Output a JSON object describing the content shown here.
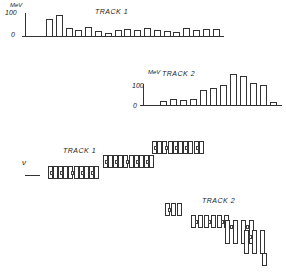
{
  "figure": {
    "panel_track1_hist": {
      "label": "TRACK 1",
      "unit": "MeV",
      "tick_top": "100",
      "tick_zero": "0"
    },
    "panel_track2_hist": {
      "label": "TRACK 2",
      "unit": "MeV",
      "tick_top": "100",
      "tick_zero": "0"
    },
    "panel_track1_cells": {
      "label": "TRACK 1",
      "beam_label": "ν"
    },
    "panel_track2_cells": {
      "label": "TRACK 2"
    }
  },
  "chart_data": [
    {
      "type": "bar",
      "title": "TRACK 1",
      "ylabel": "MeV",
      "ylim": [
        0,
        110
      ],
      "yticks": [
        0,
        100
      ],
      "values": [
        75,
        95,
        35,
        25,
        40,
        22,
        15,
        25,
        30,
        25,
        35,
        25,
        22,
        20,
        35,
        28,
        30,
        30
      ]
    },
    {
      "type": "bar",
      "title": "TRACK 2",
      "ylabel": "MeV",
      "ylim": [
        0,
        150
      ],
      "yticks": [
        0,
        100
      ],
      "values": [
        20,
        25,
        22,
        25,
        70,
        75,
        90,
        140,
        130,
        100,
        90,
        12
      ]
    }
  ]
}
